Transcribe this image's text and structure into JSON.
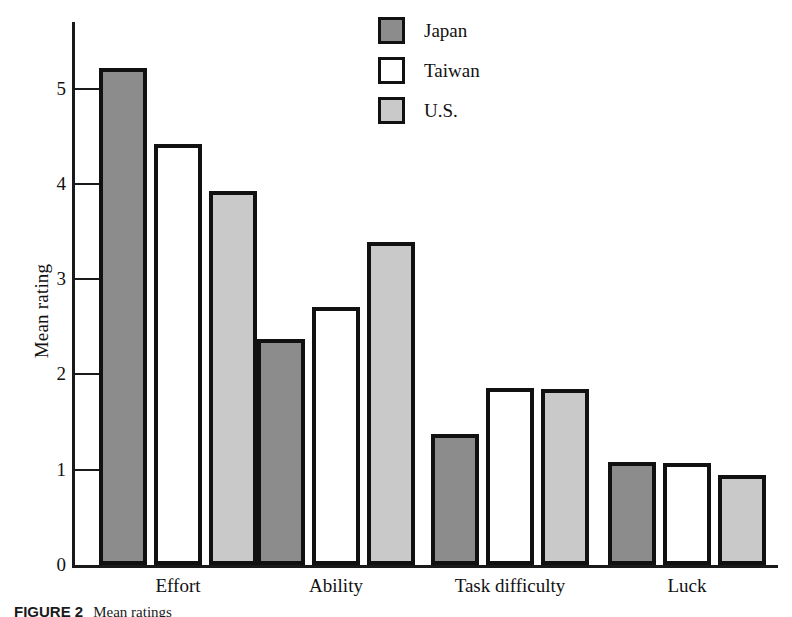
{
  "figure": {
    "caption_prefix": "FIGURE 2",
    "caption_rest": "Mean ratings"
  },
  "axes": {
    "y_title": "Mean rating",
    "y_ticks": [
      "0",
      "1",
      "2",
      "3",
      "4",
      "5"
    ]
  },
  "legend": {
    "items": [
      {
        "label": "Japan",
        "swatch": "dark-gray-square",
        "color": "#8c8c8c"
      },
      {
        "label": "Taiwan",
        "swatch": "white-square",
        "color": "#ffffff"
      },
      {
        "label": "U.S.",
        "swatch": "light-gray-square",
        "color": "#c9c9c9"
      }
    ]
  },
  "chart_data": {
    "type": "bar",
    "title": "",
    "xlabel": "",
    "ylabel": "Mean rating",
    "ylim": [
      0,
      5.6
    ],
    "yticks": [
      0,
      1,
      2,
      3,
      4,
      5
    ],
    "grid": false,
    "legend_position": "top-center",
    "categories": [
      "Effort",
      "Ability",
      "Task difficulty",
      "Luck"
    ],
    "series": [
      {
        "name": "Japan",
        "color": "#8c8c8c",
        "values": [
          5.22,
          2.37,
          1.38,
          1.08
        ]
      },
      {
        "name": "Taiwan",
        "color": "#ffffff",
        "values": [
          4.42,
          2.71,
          1.86,
          1.07
        ]
      },
      {
        "name": "U.S.",
        "color": "#c9c9c9",
        "values": [
          3.92,
          3.39,
          1.85,
          0.94
        ]
      }
    ]
  }
}
